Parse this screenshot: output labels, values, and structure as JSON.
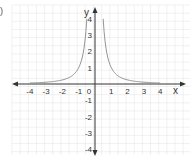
{
  "figure": {
    "corner_mark": ")"
  },
  "chart_data": {
    "type": "line",
    "title": "",
    "xlabel": "x",
    "ylabel": "y",
    "xlim": [
      -4,
      4
    ],
    "ylim": [
      -4,
      4
    ],
    "grid": true,
    "x_ticks": [
      -4,
      -3,
      -2,
      -1,
      0,
      1,
      2,
      3,
      4
    ],
    "y_ticks": [
      4,
      3,
      2,
      1,
      -1,
      -2,
      -3,
      -4
    ],
    "x_tick_labels": [
      "-4",
      "-3",
      "-2",
      "-1",
      "0",
      "1",
      "2",
      "3",
      "4"
    ],
    "y_tick_labels": [
      "4",
      "3",
      "2",
      "1",
      "-1",
      "-2",
      "-3",
      "-4"
    ],
    "series": [
      {
        "name": "y = 1/x^2",
        "description": "Two branches approaching the y-axis asymptotically and decaying toward the x-axis",
        "left_branch": {
          "x": [
            -4,
            -3,
            -2,
            -1.5,
            -1,
            -0.75,
            -0.5
          ],
          "y": [
            0.0625,
            0.111,
            0.25,
            0.444,
            1,
            1.778,
            4
          ]
        },
        "right_branch": {
          "x": [
            0.5,
            0.75,
            1,
            1.5,
            2,
            3,
            4
          ],
          "y": [
            4,
            1.778,
            1,
            0.444,
            0.25,
            0.111,
            0.0625
          ]
        }
      }
    ],
    "colors": {
      "curve": "#888888",
      "axes": "#333333",
      "grid": "#e2e2e2"
    }
  }
}
